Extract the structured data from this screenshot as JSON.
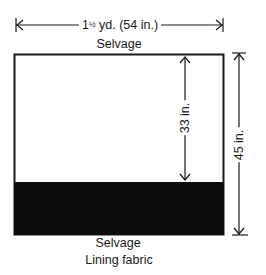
{
  "diagram": {
    "type": "fabric-layout",
    "width_label_whole": "1",
    "width_label_frac": "½",
    "width_label_rest": " yd. (54 in.)",
    "top_edge_label": "Selvage",
    "bottom_edge_label": "Selvage",
    "caption": "Lining fabric",
    "inner_dimension_label": "33 in.",
    "outer_dimension_label": "45 in.",
    "colors": {
      "line": "#1a1a1a",
      "fill_cut": "#0d0d0d",
      "background": "#ffffff"
    }
  }
}
